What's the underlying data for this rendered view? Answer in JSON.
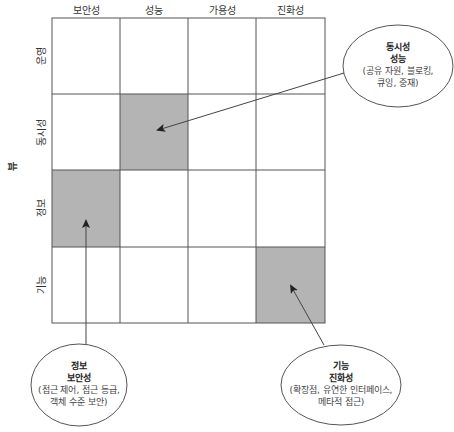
{
  "diagram": {
    "axis_label": "뷰",
    "columns": [
      "보안성",
      "성능",
      "가용성",
      "진화성"
    ],
    "rows": [
      "운영",
      "동시성",
      "정보",
      "기능"
    ],
    "shade_color": "#b4b4b4",
    "line_color": "#555555",
    "highlighted_cells": [
      {
        "row": "동시성",
        "col": "성능"
      },
      {
        "row": "정보",
        "col": "보안성"
      },
      {
        "row": "기능",
        "col": "진화성"
      }
    ],
    "callouts": [
      {
        "view": "동시성",
        "perspective": "성능",
        "detail_1": "(공유 자원, 블로킹,",
        "detail_2": "큐잉, 중재)"
      },
      {
        "view": "정보",
        "perspective": "보안성",
        "detail_1": "(접근 제어, 접근 등급,",
        "detail_2": "객체 수준 보안)"
      },
      {
        "view": "기능",
        "perspective": "진화성",
        "detail_1": "(확장점, 유연한 인터페이스,",
        "detail_2": "메타적 접근)"
      }
    ]
  }
}
